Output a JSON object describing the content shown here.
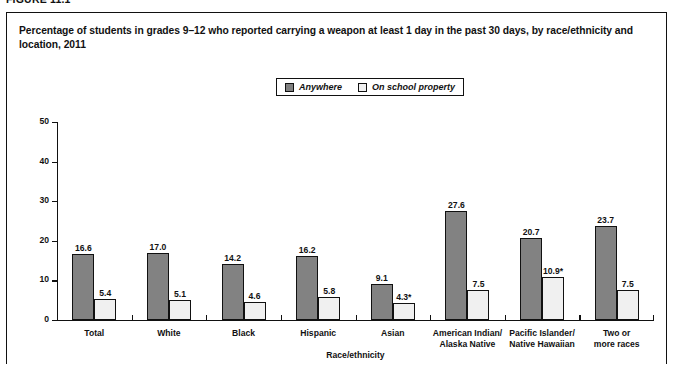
{
  "figure": {
    "number": "FIGURE 11.1",
    "title": "Percentage of students in grades 9–12 who reported carrying a weapon at least 1 day in the past 30 days, by race/ethnicity and location, 2011"
  },
  "chart_data": {
    "type": "bar",
    "title": "Percentage of students in grades 9–12 who reported carrying a weapon at least 1 day in the past 30 days, by race/ethnicity and location, 2011",
    "xlabel": "Race/ethnicity",
    "ylabel": "Percent",
    "ylim": [
      0,
      50
    ],
    "yticks": [
      0,
      10,
      20,
      30,
      40,
      50
    ],
    "ytick_labels": [
      "0",
      "10",
      "20",
      "30",
      "40",
      "50"
    ],
    "grid": false,
    "legend_position": "top-center",
    "categories": [
      "Total",
      "White",
      "Black",
      "Hispanic",
      "Asian",
      "American Indian/\nAlaska Native",
      "Pacific Islander/\nNative Hawaiian",
      "Two or\nmore races"
    ],
    "category_lines": [
      [
        "Total"
      ],
      [
        "White"
      ],
      [
        "Black"
      ],
      [
        "Hispanic"
      ],
      [
        "Asian"
      ],
      [
        "American Indian/",
        "Alaska Native"
      ],
      [
        "Pacific Islander/",
        "Native Hawaiian"
      ],
      [
        "Two or",
        "more races"
      ]
    ],
    "series": [
      {
        "name": "Anywhere",
        "color": "#828282",
        "values": [
          16.6,
          17.0,
          14.2,
          16.2,
          9.1,
          27.6,
          20.7,
          23.7
        ],
        "labels": [
          "16.6",
          "17.0",
          "14.2",
          "16.2",
          "9.1",
          "27.6",
          "20.7",
          "23.7"
        ]
      },
      {
        "name": "On school property",
        "color": "#f0f0f0",
        "values": [
          5.4,
          5.1,
          4.6,
          5.8,
          4.3,
          7.5,
          10.9,
          7.5
        ],
        "labels": [
          "5.4",
          "5.1",
          "4.6",
          "5.8",
          "4.3*",
          "7.5",
          "10.9*",
          "7.5"
        ]
      }
    ]
  }
}
